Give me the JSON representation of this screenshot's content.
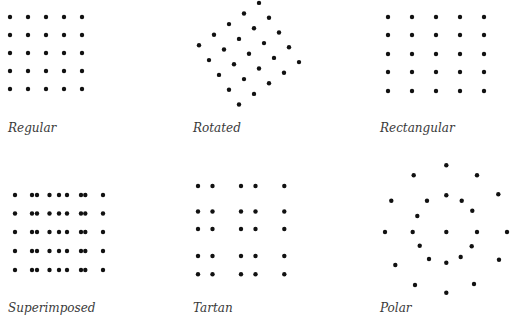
{
  "panels": [
    {
      "id": "regular",
      "label": "Regular",
      "dot_count": 25,
      "layout": "5 x 5 square grid"
    },
    {
      "id": "rotated",
      "label": "Rotated",
      "dot_count": 25,
      "layout": "5 x 5 grid rotated ~35 degrees"
    },
    {
      "id": "rectangular",
      "label": "Rectangular",
      "dot_count": 25,
      "layout": "5 x 5 grid, wider column spacing than row spacing"
    },
    {
      "id": "superimposed",
      "label": "Superimposed",
      "dot_count": 45,
      "layout": "two regular grids with different column spacing overlaid (5 + 4 columns x 5 rows)"
    },
    {
      "id": "tartan",
      "label": "Tartan",
      "dot_count": 25,
      "layout": "5 x 5 grid with paired (non-uniform) column and row spacing"
    },
    {
      "id": "polar",
      "label": "Polar",
      "dot_count": 25,
      "layout": "center point plus concentric rings"
    }
  ]
}
